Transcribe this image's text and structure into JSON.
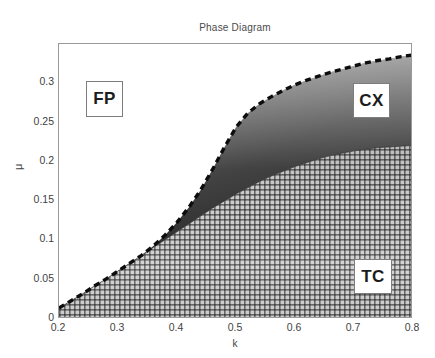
{
  "chart_data": {
    "type": "area",
    "title": "Phase Diagram",
    "xlabel": "k",
    "ylabel": "μ",
    "xlim": [
      0.2,
      0.8
    ],
    "ylim": [
      0.0,
      0.35
    ],
    "grid": false,
    "legend_position": "in-plot-annotations",
    "xticks": [
      0.2,
      0.3,
      0.4,
      0.5,
      0.6,
      0.7,
      0.8
    ],
    "xticklabels": [
      "0.2",
      "0.3",
      "0.4",
      "0.5",
      "0.6",
      "0.7",
      "0.8"
    ],
    "yticks": [
      0,
      0.05,
      0.1,
      0.15,
      0.2,
      0.25,
      0.3
    ],
    "yticklabels": [
      "0",
      "0.05",
      "0.1",
      "0.15",
      "0.2",
      "0.25",
      "0.3"
    ],
    "regions": [
      {
        "name": "FP",
        "label": "FP",
        "description": "fixed point region, white / unshaded, upper-left of dashed boundary",
        "fill": "#ffffff",
        "label_x": 0.25,
        "label_y": 0.302
      },
      {
        "name": "CX",
        "label": "CX",
        "description": "complex region, dark grayscale gradient wedge between dashed upper boundary and cross-hatched TC region",
        "fill": "#2b2b2b",
        "label_x": 0.702,
        "label_y": 0.297
      },
      {
        "name": "TC",
        "label": "TC",
        "description": "two-cycle region, fine cross-hatched grid, lower-right",
        "fill": "#b9b9b9",
        "label_x": 0.704,
        "label_y": 0.072
      }
    ],
    "boundaries": [
      {
        "name": "upper-boundary-dashed",
        "style": "dashed",
        "color": "#111111",
        "linewidth": 3,
        "comment": "separates FP (above/left) from CX (below/right)",
        "x": [
          0.2,
          0.22,
          0.24,
          0.26,
          0.28,
          0.3,
          0.32,
          0.34,
          0.36,
          0.38,
          0.4,
          0.42,
          0.44,
          0.46,
          0.48,
          0.5,
          0.52,
          0.54,
          0.56,
          0.58,
          0.6,
          0.62,
          0.64,
          0.66,
          0.68,
          0.7,
          0.72,
          0.74,
          0.76,
          0.78,
          0.8
        ],
        "y": [
          0.014,
          0.023,
          0.032,
          0.042,
          0.051,
          0.061,
          0.071,
          0.081,
          0.093,
          0.107,
          0.123,
          0.142,
          0.164,
          0.19,
          0.218,
          0.244,
          0.262,
          0.274,
          0.283,
          0.291,
          0.298,
          0.304,
          0.309,
          0.314,
          0.318,
          0.322,
          0.326,
          0.329,
          0.331,
          0.334,
          0.336
        ]
      },
      {
        "name": "lower-boundary-tc",
        "style": "solid-implicit",
        "color": "#3a3a3a",
        "linewidth": 1,
        "comment": "top edge of cross-hatched TC region; separates CX (above) from TC (below)",
        "x": [
          0.2,
          0.22,
          0.24,
          0.26,
          0.28,
          0.3,
          0.32,
          0.34,
          0.36,
          0.38,
          0.4,
          0.42,
          0.44,
          0.46,
          0.48,
          0.5,
          0.52,
          0.54,
          0.56,
          0.58,
          0.6,
          0.62,
          0.64,
          0.66,
          0.68,
          0.7,
          0.72,
          0.74,
          0.76,
          0.78,
          0.8
        ],
        "y": [
          0.014,
          0.023,
          0.032,
          0.042,
          0.051,
          0.061,
          0.071,
          0.081,
          0.091,
          0.101,
          0.111,
          0.121,
          0.131,
          0.141,
          0.15,
          0.159,
          0.167,
          0.175,
          0.182,
          0.188,
          0.194,
          0.199,
          0.204,
          0.208,
          0.211,
          0.214,
          0.216,
          0.218,
          0.219,
          0.22,
          0.221
        ]
      }
    ]
  },
  "figure": {
    "background": "#ffffff",
    "axes_color": "#9a9a9a",
    "text_color": "#3f3f3f"
  }
}
